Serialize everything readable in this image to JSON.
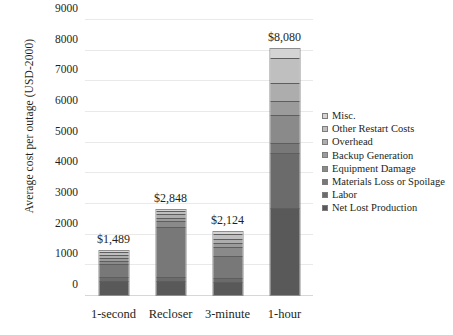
{
  "chart_data": {
    "type": "bar",
    "stacked": true,
    "title": "",
    "xlabel": "",
    "ylabel": "Average cost per outage (USD-2000)",
    "ylim": [
      0,
      9000
    ],
    "ytick_step": 1000,
    "yticks": [
      "0",
      "1000",
      "2000",
      "3000",
      "4000",
      "5000",
      "6000",
      "7000",
      "8000",
      "9000"
    ],
    "grid": true,
    "legend_position": "right",
    "categories": [
      "1-second",
      "Recloser",
      "3-minute",
      "1-hour"
    ],
    "totals": [
      1489,
      2848,
      2124,
      8080
    ],
    "total_labels": [
      "$1,489",
      "$2,848",
      "$2,124",
      "$8,080"
    ],
    "series": [
      {
        "name": "Net Lost Production",
        "color": "#595959",
        "values": [
          530,
          470,
          450,
          2900
        ]
      },
      {
        "name": "Labor",
        "color": "#6b6b6b",
        "values": [
          120,
          120,
          130,
          1850
        ]
      },
      {
        "name": "Materials Loss or Spoilage",
        "color": "#787878",
        "values": [
          470,
          1760,
          800,
          300
        ]
      },
      {
        "name": "Equipment Damage",
        "color": "#8a8a8a",
        "values": [
          110,
          180,
          280,
          900
        ]
      },
      {
        "name": "Backup Generation",
        "color": "#9b9b9b",
        "values": [
          80,
          90,
          110,
          450
        ]
      },
      {
        "name": "Overhead",
        "color": "#adadad",
        "values": [
          70,
          90,
          140,
          560
        ]
      },
      {
        "name": "Other Restart Costs",
        "color": "#bfbfbf",
        "values": [
          70,
          80,
          130,
          820
        ]
      },
      {
        "name": "Misc.",
        "color": "#d4d4d4",
        "values": [
          39,
          58,
          84,
          300
        ]
      }
    ]
  },
  "legend": {
    "items": [
      {
        "label": "Misc."
      },
      {
        "label": "Other Restart Costs"
      },
      {
        "label": "Overhead"
      },
      {
        "label": "Backup Generation"
      },
      {
        "label": "Equipment Damage"
      },
      {
        "label": "Materials Loss or Spoilage"
      },
      {
        "label": "Labor"
      },
      {
        "label": "Net Lost Production"
      }
    ]
  }
}
